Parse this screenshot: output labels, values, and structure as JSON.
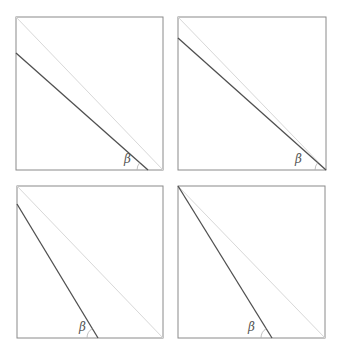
{
  "figure": {
    "panel_count": 4,
    "colors": {
      "frame": "#8a8a8a",
      "diagonal": "#d8d8d8",
      "line": "#505050",
      "arc": "#b0b0b0",
      "label": "#555555"
    },
    "panels": [
      {
        "id": "top-left",
        "square": {
          "x": 16,
          "y": 17,
          "w": 147,
          "h": 153
        },
        "diagonal": {
          "x1": 16,
          "y1": 17,
          "x2": 163,
          "y2": 170
        },
        "line": {
          "x1": 16,
          "y1": 53,
          "x2": 148,
          "y2": 170
        },
        "angle_label": "β",
        "label_pos": {
          "x": 124,
          "y": 163
        },
        "arc_center": {
          "x": 148,
          "y": 170
        }
      },
      {
        "id": "top-right",
        "square": {
          "x": 178,
          "y": 17,
          "w": 148,
          "h": 153
        },
        "diagonal": {
          "x1": 178,
          "y1": 17,
          "x2": 326,
          "y2": 170
        },
        "line": {
          "x1": 178,
          "y1": 38,
          "x2": 326,
          "y2": 170
        },
        "angle_label": "β",
        "label_pos": {
          "x": 295,
          "y": 163
        },
        "arc_center": {
          "x": 326,
          "y": 170
        }
      },
      {
        "id": "bottom-left",
        "square": {
          "x": 17,
          "y": 186,
          "w": 146,
          "h": 152
        },
        "diagonal": {
          "x1": 17,
          "y1": 186,
          "x2": 163,
          "y2": 338
        },
        "line": {
          "x1": 17,
          "y1": 204,
          "x2": 98,
          "y2": 338
        },
        "angle_label": "β",
        "label_pos": {
          "x": 79,
          "y": 331
        },
        "arc_center": {
          "x": 98,
          "y": 338
        }
      },
      {
        "id": "bottom-right",
        "square": {
          "x": 178,
          "y": 186,
          "w": 147,
          "h": 152
        },
        "diagonal": {
          "x1": 178,
          "y1": 186,
          "x2": 325,
          "y2": 338
        },
        "line": {
          "x1": 178,
          "y1": 186,
          "x2": 272,
          "y2": 338
        },
        "angle_label": "β",
        "label_pos": {
          "x": 248,
          "y": 331
        },
        "arc_center": {
          "x": 272,
          "y": 338
        }
      }
    ]
  }
}
